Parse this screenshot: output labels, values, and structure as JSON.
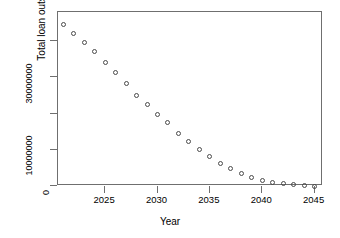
{
  "chart_data": {
    "type": "scatter",
    "title": "",
    "xlabel": "Year",
    "ylabel": "Total loan outstanding",
    "x": [
      2021,
      2022,
      2023,
      2024,
      2025,
      2026,
      2027,
      2028,
      2029,
      2030,
      2031,
      2032,
      2033,
      2034,
      2035,
      2036,
      2037,
      2038,
      2039,
      2040,
      2041,
      2042,
      2043,
      2044,
      2045
    ],
    "values": [
      44600000,
      42200000,
      39700000,
      37000000,
      34200000,
      31300000,
      28200000,
      25000000,
      22600000,
      19800000,
      17400000,
      14600000,
      12400000,
      10200000,
      8200000,
      6300000,
      4700000,
      3400000,
      2400000,
      1600000,
      1000000,
      600000,
      300000,
      150000,
      0
    ],
    "xlim": [
      2020.5,
      2045.8
    ],
    "ylim": [
      0,
      48000000
    ],
    "xticks": [
      2025,
      2030,
      2035,
      2040,
      2045
    ],
    "xtick_labels": [
      "2025",
      "2030",
      "2035",
      "2040",
      "2045"
    ],
    "yticks": [
      0,
      10000000,
      20000000,
      30000000,
      40000000
    ],
    "ytick_labels": [
      "0",
      "10000000",
      "",
      "30000000",
      ""
    ],
    "grid": false,
    "legend": null,
    "marker": "open-circle",
    "marker_color": "#4a4a4a",
    "axis_color": "#6f6f6f",
    "background": "#ffffff"
  }
}
